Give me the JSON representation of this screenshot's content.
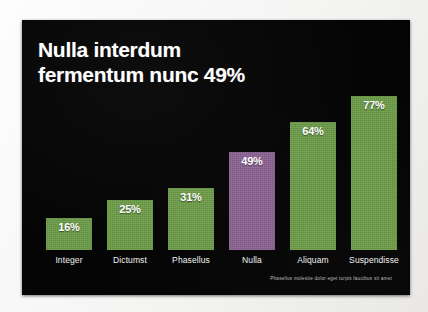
{
  "slide": {
    "title_line_1": "Nulla interdum",
    "title_line_2": "fermentum nunc 49%",
    "footnote": "Phasellus molestie dolor eget turpis faucibus sit amet",
    "background_color": "#050505",
    "title_color": "#ffffff"
  },
  "chart_data": {
    "type": "bar",
    "title": "Nulla interdum fermentum nunc 49%",
    "xlabel": "",
    "ylabel": "",
    "ylim": [
      0,
      85
    ],
    "grid": false,
    "legend": "none",
    "value_suffix": "%",
    "categories": [
      "Integer",
      "Dictumst",
      "Phasellus",
      "Nulla",
      "Aliquam",
      "Suspendisse"
    ],
    "values": [
      16,
      25,
      31,
      49,
      64,
      77
    ],
    "value_labels": [
      "16%",
      "25%",
      "31%",
      "49%",
      "64%",
      "77%"
    ],
    "highlight_category": "Nulla",
    "colors": {
      "bar": "#6b9b47",
      "highlight": "#8a5f91",
      "label": "#f2f2f2",
      "value": "#ffffff"
    },
    "annotation": "Phasellus molestie dolor eget turpis faucibus sit amet"
  }
}
